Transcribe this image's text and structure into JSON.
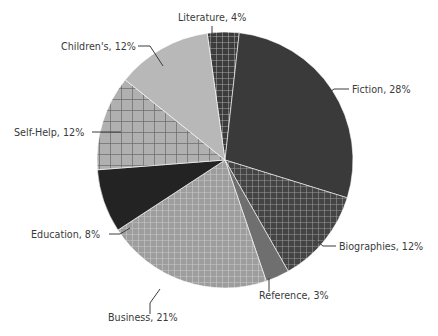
{
  "chart_data": {
    "type": "pie",
    "title": "",
    "subtitle": "",
    "xlabel": "",
    "ylabel": "",
    "legend_position": "none",
    "grid": false,
    "labels_show_percent": true,
    "total_percent": 100,
    "start_angle_deg": -8,
    "direction": "clockwise",
    "categories": [
      "Literature",
      "Fiction",
      "Biographies",
      "Reference",
      "Business",
      "Education",
      "Self-Help",
      "Children's"
    ],
    "values": [
      4,
      28,
      12,
      3,
      21,
      8,
      12,
      12
    ],
    "slices": [
      {
        "name": "Literature",
        "value": 4,
        "label": "Literature, 4%",
        "color": "#3c3c3c",
        "pattern": "fine-grid",
        "pattern_color": "#a8a8a8",
        "label_x": 178,
        "label_y": 21,
        "label_anchor": "start",
        "leader": "M 212 26 L 212 43"
      },
      {
        "name": "Fiction",
        "value": 28,
        "label": "Fiction, 28%",
        "color": "#3a3a3a",
        "pattern": "solid",
        "pattern_color": "#3a3a3a",
        "label_x": 352,
        "label_y": 93,
        "label_anchor": "start",
        "leader": "M 349 89 L 334 89 L 322 98"
      },
      {
        "name": "Biographies",
        "value": 12,
        "label": "Biographies, 12%",
        "color": "#444444",
        "pattern": "fine-grid",
        "pattern_color": "#9a9a9a",
        "label_x": 339,
        "label_y": 250,
        "label_anchor": "start",
        "leader": "M 336 246 L 323 246 L 313 238"
      },
      {
        "name": "Reference",
        "value": 3,
        "label": "Reference, 3%",
        "color": "#6f6f6f",
        "pattern": "solid",
        "pattern_color": "#6f6f6f",
        "label_x": 259,
        "label_y": 299,
        "label_anchor": "start",
        "leader": "M 269 292 L 269 278"
      },
      {
        "name": "Business",
        "value": 21,
        "label": "Business, 21%",
        "color": "#9d9d9d",
        "pattern": "fine-grid",
        "pattern_color": "#c9c9c9",
        "label_x": 108,
        "label_y": 321,
        "label_anchor": "start",
        "leader": "M 150 314 L 150 303 L 160 289"
      },
      {
        "name": "Education",
        "value": 8,
        "label": "Education, 8%",
        "color": "#232323",
        "pattern": "solid",
        "pattern_color": "#232323",
        "label_x": 31,
        "label_y": 238,
        "label_anchor": "start",
        "leader": "M 109 234 L 120 234 L 130 228"
      },
      {
        "name": "Self-Help",
        "value": 12,
        "label": "Self-Help, 12%",
        "color": "#b0b0b0",
        "pattern": "coarse-grid",
        "pattern_color": "#6e6e6e",
        "label_x": 14,
        "label_y": 136,
        "label_anchor": "start",
        "leader": "M 92 132 L 121 132"
      },
      {
        "name": "Children's",
        "value": 12,
        "label": "Children's, 12%",
        "color": "#b8b8b8",
        "pattern": "solid",
        "pattern_color": "#b8b8b8",
        "label_x": 61,
        "label_y": 50,
        "label_anchor": "start",
        "leader": "M 138 46 L 150 46 L 163 66"
      }
    ],
    "geometry": {
      "center_x": 225,
      "center_y": 160,
      "radius": 128
    }
  }
}
